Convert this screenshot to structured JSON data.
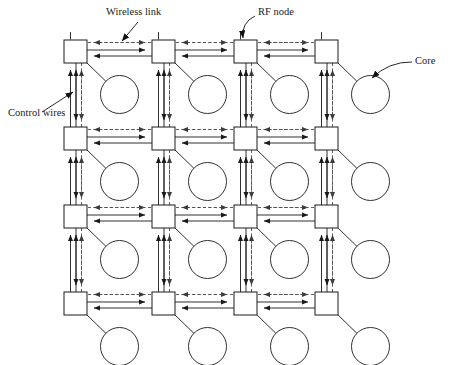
{
  "figure": {
    "background_color": "#ffffff",
    "line_color": "#1a1a1a",
    "dashed_color": "#4d4d4d",
    "width": 450,
    "height": 365
  },
  "labels": [
    {
      "id": "wireless-link",
      "text": "Wireless link",
      "x": 106,
      "y": 13,
      "anchor": "start"
    },
    {
      "id": "rf-node",
      "text": "RF node",
      "x": 258,
      "y": 13,
      "anchor": "start"
    },
    {
      "id": "core",
      "text": "Core",
      "x": 415,
      "y": 62,
      "anchor": "start"
    },
    {
      "id": "control-wires",
      "text": "Control wires",
      "x": 8,
      "y": 114,
      "anchor": "start"
    }
  ],
  "leaders": [
    {
      "id": "wireless-link-leader",
      "from_x": 138,
      "from_y": 22,
      "to_x": 122,
      "to_y": 41,
      "curved": false
    },
    {
      "id": "rf-node-leader",
      "from_x": 255,
      "from_y": 16,
      "to_x": 243,
      "to_y": 38,
      "curved": true
    },
    {
      "id": "core-leader",
      "from_x": 412,
      "from_y": 62,
      "to_x": 372,
      "to_y": 78,
      "curved": true
    },
    {
      "id": "control-wires-leader",
      "from_x": 42,
      "from_y": 112,
      "to_x": 73,
      "to_y": 92,
      "curved": false
    }
  ],
  "grid": {
    "rows": 4,
    "cols": 4,
    "node_size": 23,
    "col_x": [
      64,
      152,
      234,
      315
    ],
    "row_y": [
      40,
      127,
      205,
      292
    ],
    "core_radius": 19,
    "core_offset_x": 44,
    "core_offset_y": 43
  },
  "legend_items": [
    {
      "id": "node",
      "name": "RF node",
      "shape": "square"
    },
    {
      "id": "core",
      "name": "Core",
      "shape": "circle"
    },
    {
      "id": "wireless-link",
      "name": "Wireless link",
      "shape": "dashed-line"
    },
    {
      "id": "control-wires",
      "name": "Control wires",
      "shape": "solid-line-pair"
    }
  ],
  "link_style": {
    "solid_pair_gap": 6,
    "dashed_offset": 9,
    "dash_pattern": "3,2.4",
    "solid_width": 0.9,
    "dashed_width": 0.9
  }
}
